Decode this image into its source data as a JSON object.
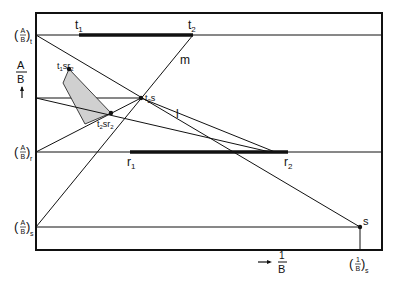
{
  "diagram": {
    "colors": {
      "line": "#111111",
      "region_fill": "#d0d0d0",
      "background": "#ffffff"
    },
    "y_axis": {
      "label_num": "A",
      "label_den": "B",
      "arrow": "up-arrow",
      "levels": [
        {
          "id": "t",
          "num": "A",
          "den": "B",
          "sub": "t"
        },
        {
          "id": "r",
          "num": "A",
          "den": "B",
          "sub": "r"
        },
        {
          "id": "s",
          "num": "A",
          "den": "B",
          "sub": "s"
        }
      ]
    },
    "x_axis": {
      "arrow": "right-arrow",
      "label_num": "1",
      "label_den": "B",
      "tick": {
        "num": "1",
        "den": "B",
        "sub": "s"
      }
    },
    "bars": [
      {
        "id": "t-range",
        "start_label": "t",
        "start_sub": "1",
        "end_label": "t",
        "end_sub": "2"
      },
      {
        "id": "r-range",
        "start_label": "r",
        "start_sub": "1",
        "end_label": "r",
        "end_sub": "2"
      }
    ],
    "lines": [
      {
        "id": "m",
        "label": "m"
      },
      {
        "id": "l",
        "label": "l"
      }
    ],
    "points": [
      {
        "id": "t1sr2",
        "parts": [
          "t",
          "1",
          "s",
          "r",
          "2"
        ]
      },
      {
        "id": "t2s",
        "parts": [
          "t",
          "2",
          "s"
        ]
      },
      {
        "id": "t2sr2",
        "parts": [
          "t",
          "2",
          "s",
          "r",
          "2"
        ]
      },
      {
        "id": "s",
        "label": "s"
      }
    ]
  }
}
